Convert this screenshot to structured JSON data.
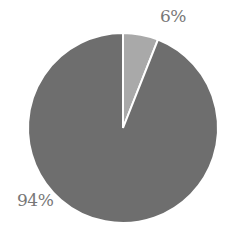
{
  "chart_data": {
    "type": "pie",
    "title": "",
    "categories": [
      "Slice A",
      "Slice B"
    ],
    "values": [
      6,
      94
    ],
    "labels": [
      "6%",
      "94%"
    ],
    "colors": [
      "#a9a9a9",
      "#6e6e6e"
    ],
    "start_angle_deg": 0,
    "direction": "clockwise",
    "legend": "none",
    "grid": false
  },
  "labels": {
    "small": "6%",
    "large": "94%"
  }
}
